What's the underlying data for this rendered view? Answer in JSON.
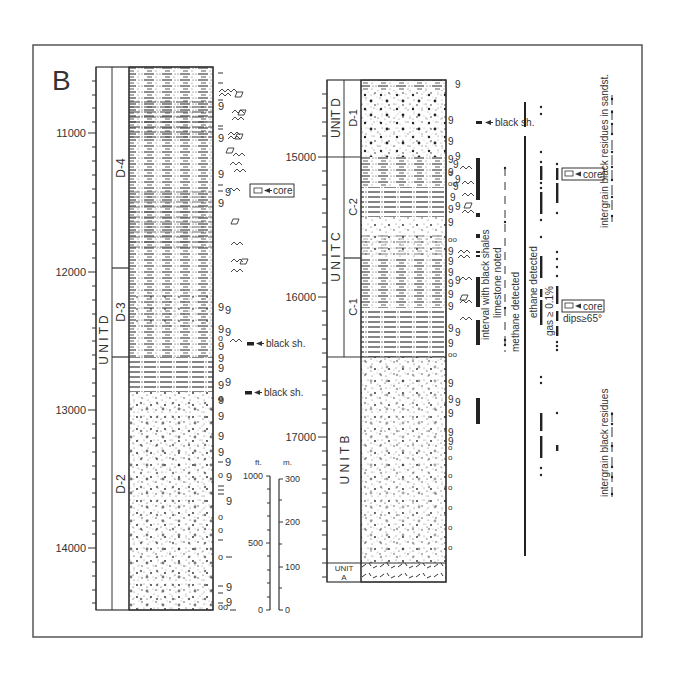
{
  "figure": {
    "panel_label": "B",
    "frame_color": "#555555",
    "ink_color": "#222222"
  },
  "left_column": {
    "depth_ticks": [
      {
        "label": "11000",
        "y": 133
      },
      {
        "label": "12000",
        "y": 272
      },
      {
        "label": "13000",
        "y": 410
      },
      {
        "label": "14000",
        "y": 548
      }
    ],
    "unit_label": "U N I T   D",
    "subunits": [
      {
        "label": "D-4",
        "top": 67,
        "bottom": 268
      },
      {
        "label": "D-3",
        "top": 268,
        "bottom": 357
      },
      {
        "label": "D-2",
        "top": 357,
        "bottom": 610
      }
    ],
    "annotations": {
      "core": "core",
      "black_shale_1": "black sh.",
      "black_shale_2": "black sh."
    }
  },
  "scale_bar": {
    "ft_label": "ft.",
    "m_label": "m.",
    "ft_ticks": [
      "1000",
      "500",
      "0"
    ],
    "m_ticks": [
      "300",
      "200",
      "100",
      "0"
    ]
  },
  "right_column": {
    "depth_ticks": [
      {
        "label": "15000",
        "y": 157
      },
      {
        "label": "16000",
        "y": 297
      },
      {
        "label": "17000",
        "y": 437
      }
    ],
    "units": [
      {
        "label": "UNIT D",
        "sub": "D-1",
        "top": 80,
        "bottom": 157
      },
      {
        "label": "U N I T   C",
        "sub_upper": "C-2",
        "sub_lower": "C-1",
        "top": 157,
        "split": 258,
        "bottom": 357
      },
      {
        "label": "U N I T   B",
        "top": 357,
        "bottom": 563
      },
      {
        "label": "UNIT A",
        "top": 563,
        "bottom": 582
      }
    ],
    "annotations": {
      "black_shale": "black sh.",
      "interval_black_shales": "interval with black shales",
      "limestone": "limestone noted",
      "methane": "methane detected",
      "ethane": "ethane detected",
      "gas": "gas ≥ 0.1%",
      "core_1": "core",
      "core_2": "core",
      "dips": "dips≥65°",
      "intergrain_sandst": "intergrain black residues in sandst.",
      "intergrain": "intergrain black residues"
    }
  }
}
